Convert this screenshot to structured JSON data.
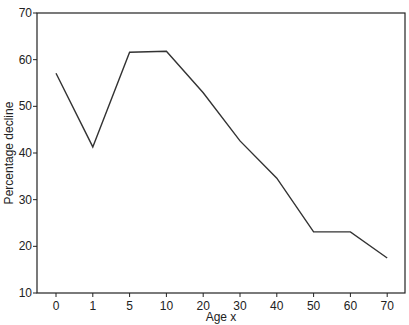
{
  "chart_data": {
    "type": "line",
    "title": "",
    "xlabel": "Age x",
    "ylabel": "Percentage decline",
    "categories": [
      "0",
      "1",
      "5",
      "10",
      "20",
      "30",
      "40",
      "50",
      "60",
      "70"
    ],
    "series": [
      {
        "name": "Percentage decline",
        "values": [
          57.1,
          41.3,
          61.6,
          61.8,
          52.9,
          42.6,
          34.6,
          23.1,
          23.1,
          17.5
        ]
      }
    ],
    "ylim": [
      10,
      70
    ],
    "yticks": [
      10,
      20,
      30,
      40,
      50,
      60,
      70
    ],
    "grid": false,
    "legend": "none",
    "colors": {
      "line": "#333333",
      "axis": "#222222"
    }
  }
}
